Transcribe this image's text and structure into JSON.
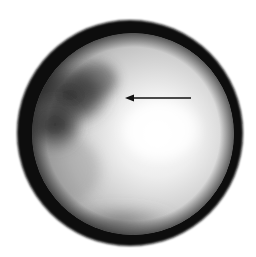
{
  "image": {
    "description": "Circular grayscale field of view (endoscopic/microscopic style) with dark rim and an arrow annotation",
    "background": "#ffffff",
    "field": {
      "center_x": 130,
      "center_y": 133,
      "outer_radius": 113,
      "inner_radius": 101,
      "rim_color": "#0d0d0d",
      "bright_region_color": "#ffffff",
      "mid_tone_color": "#bdbdbd",
      "dark_region_color": "#2a2a2a"
    },
    "annotation": {
      "type": "arrow",
      "direction": "left",
      "x1": 191,
      "y1": 98,
      "x2": 126,
      "y2": 98,
      "color": "#111111"
    }
  }
}
